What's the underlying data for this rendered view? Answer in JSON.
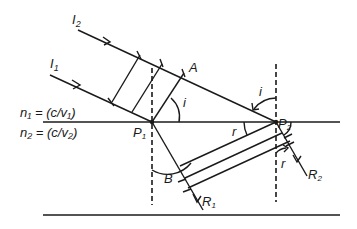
{
  "diagram": {
    "type": "refraction-wavefront",
    "labels": {
      "ray_incident_2": "I",
      "ray_incident_2_sub": "2",
      "ray_incident_1": "I",
      "ray_incident_1_sub": "1",
      "point_A": "A",
      "angle_i_left": "i",
      "angle_i_right": "i",
      "angle_r_left": "r",
      "angle_r_right": "r",
      "point_P1": "P",
      "point_P1_sub": "1",
      "point_P2": "P",
      "point_P2_sub": "2",
      "point_B": "B",
      "ray_refracted_1": "R",
      "ray_refracted_1_sub": "1",
      "ray_refracted_2": "R",
      "ray_refracted_2_sub": "2",
      "medium_1": "n₁ = (c/v₁)",
      "medium_2": "n₂ = (c/v₂)"
    },
    "colors": {
      "ink": "#1a1a1a",
      "background": "#ffffff"
    }
  }
}
